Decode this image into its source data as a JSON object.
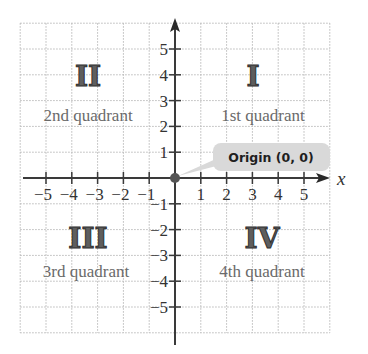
{
  "diagram": {
    "type": "coordinate-plane",
    "x_axis_label": "x",
    "x_range": [
      -6,
      6
    ],
    "y_range": [
      -6,
      6
    ],
    "x_ticks": [
      {
        "value": -5,
        "label": "−5"
      },
      {
        "value": -4,
        "label": "−4"
      },
      {
        "value": -3,
        "label": "−3"
      },
      {
        "value": -2,
        "label": "−2"
      },
      {
        "value": -1,
        "label": "−1"
      },
      {
        "value": 1,
        "label": "1"
      },
      {
        "value": 2,
        "label": "2"
      },
      {
        "value": 3,
        "label": "3"
      },
      {
        "value": 4,
        "label": "4"
      },
      {
        "value": 5,
        "label": "5"
      }
    ],
    "y_ticks": [
      {
        "value": 5,
        "label": "5"
      },
      {
        "value": 4,
        "label": "4"
      },
      {
        "value": 3,
        "label": "3"
      },
      {
        "value": 2,
        "label": "2"
      },
      {
        "value": 1,
        "label": "1"
      },
      {
        "value": -1,
        "label": "−1"
      },
      {
        "value": -2,
        "label": "−2"
      },
      {
        "value": -3,
        "label": "−3"
      },
      {
        "value": -4,
        "label": "−4"
      },
      {
        "value": -5,
        "label": "−5"
      }
    ],
    "quadrants": [
      {
        "numeral": "I",
        "label": "1st quadrant"
      },
      {
        "numeral": "II",
        "label": "2nd quadrant"
      },
      {
        "numeral": "III",
        "label": "3rd quadrant"
      },
      {
        "numeral": "IV",
        "label": "4th quadrant"
      }
    ],
    "origin_callout": "Origin (0, 0)",
    "colors": {
      "axis": "#3a3a3a",
      "grid": "#b8b8b8",
      "numeral_fill": "#5e5e5e",
      "quadrant_label": "#6a6a6a",
      "callout_bg": "#d9d9d9",
      "origin_dot": "#555555"
    }
  }
}
